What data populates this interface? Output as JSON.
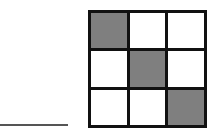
{
  "answer_blank": {
    "visible": true
  },
  "grid": {
    "rows": 3,
    "cols": 3,
    "fill_color": "#7f7f7f",
    "empty_color": "#ffffff",
    "border_color": "#111111",
    "cells": [
      [
        true,
        false,
        false
      ],
      [
        false,
        true,
        false
      ],
      [
        false,
        false,
        true
      ]
    ]
  }
}
